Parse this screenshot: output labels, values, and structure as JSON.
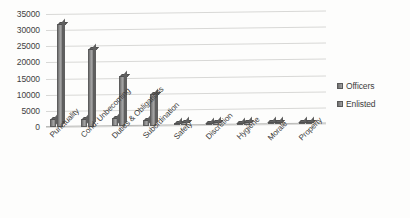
{
  "chart_data": {
    "type": "bar",
    "title": "",
    "xlabel": "",
    "ylabel": "",
    "ylim": [
      0,
      35000
    ],
    "ytick_step": 5000,
    "yticks": [
      "35000",
      "30000",
      "25000",
      "20000",
      "15000",
      "10000",
      "5000",
      "0"
    ],
    "grid": true,
    "legend_position": "right",
    "categories": [
      "Punctuality",
      "Cond. Unbecoming",
      "Duties & Obligations",
      "Subordination",
      "Safety",
      "Discretion",
      "Hygiene",
      "Morale",
      "Property"
    ],
    "series": [
      {
        "name": "Officers",
        "values": [
          2600,
          2200,
          2400,
          1800,
          500,
          300,
          300,
          250,
          200
        ]
      },
      {
        "name": "Enlisted",
        "values": [
          32000,
          24000,
          15500,
          10000,
          1200,
          900,
          800,
          700,
          600
        ]
      }
    ]
  },
  "legend": {
    "items": [
      {
        "label": "Officers"
      },
      {
        "label": "Enlisted"
      }
    ]
  }
}
